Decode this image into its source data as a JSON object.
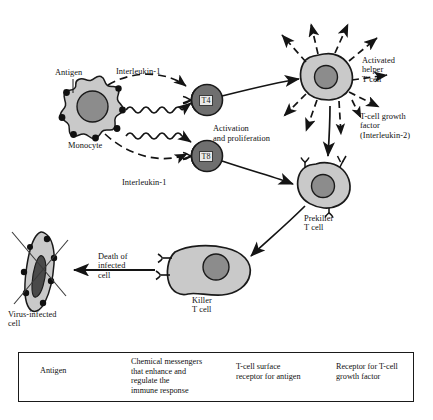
{
  "diagram": {
    "colors": {
      "cell_fill": "#c9c9c9",
      "nucleus_fill": "#8c8c8c",
      "tcell_fill": "#909090",
      "outline": "#1a1a1a",
      "background": "#ffffff",
      "infected_nucleus": "#4a4a4a"
    },
    "labels": {
      "antigen": "Antigen",
      "monocyte": "Monocyte",
      "interleukin1_top": "Interleukin-1",
      "interleukin1_bottom": "Interleukin-1",
      "t4": "T4",
      "t8": "T8",
      "activation": "Activation\nand proliferation",
      "activated_helper": "Activated\nhelper\nT cell",
      "growth_factor": "T-cell growth\nfactor\n(Interleukin-2)",
      "prekiller": "Prekiller\nT cell",
      "killer": "Killer\nT cell",
      "death": "Death of\ninfected\ncell",
      "virus_infected": "Virus-infected\ncell"
    }
  },
  "legend": {
    "items": [
      {
        "symbol": "antigen-dot",
        "text": "Antigen"
      },
      {
        "symbol": "dashed-line",
        "text": "Chemical messengers\nthat enhance and\nregulate the\nimmune response"
      },
      {
        "symbol": "y-receptor",
        "text": "T-cell surface\nreceptor for antigen"
      },
      {
        "symbol": "v-receptor",
        "text": "Receptor for T-cell\ngrowth factor"
      }
    ]
  }
}
